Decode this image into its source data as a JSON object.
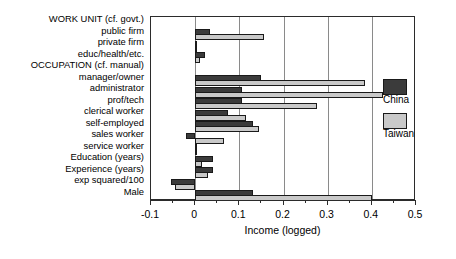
{
  "chart_data": {
    "type": "bar",
    "orientation": "horizontal",
    "title": "",
    "xlabel": "Income (logged)",
    "ylabel": "",
    "xlim": [
      -0.1,
      0.5
    ],
    "xticks": [
      -0.1,
      0,
      0.1,
      0.2,
      0.3,
      0.4,
      0.5
    ],
    "xticklabels": [
      "-0.1",
      "0",
      "0.1",
      "0.2",
      "0.3",
      "0.4",
      "0.5"
    ],
    "minor_tick_step": 0.05,
    "grid": "vertical",
    "legend_position": "right-outside",
    "categories": [
      "WORK UNIT (cf. govt.)",
      "public firm",
      "private firm",
      "educ/health/etc.",
      "OCCUPATION (cf. manual)",
      "manager/owner",
      "administrator",
      "prof/tech",
      "clerical worker",
      "self-employed",
      "sales worker",
      "service worker",
      "Education (years)",
      "Experience (years)",
      "exp squared/100",
      "Male"
    ],
    "header_categories": [
      "WORK UNIT (cf. govt.)",
      "OCCUPATION (cf. manual)"
    ],
    "series": [
      {
        "name": "China",
        "color": "#3b3b3b",
        "values": [
          null,
          0.033,
          0.002,
          0.022,
          null,
          0.15,
          0.105,
          0.105,
          0.075,
          0.13,
          -0.02,
          0.002,
          0.04,
          0.04,
          -0.055,
          0.13
        ]
      },
      {
        "name": "Taiwan",
        "color": "#c9c9c9",
        "values": [
          null,
          0.155,
          0.001,
          0.01,
          null,
          0.385,
          0.425,
          0.275,
          0.115,
          0.145,
          0.065,
          0.003,
          0.015,
          0.03,
          -0.045,
          0.4
        ]
      }
    ]
  },
  "legend": {
    "entries": [
      {
        "label": "China",
        "color": "#3b3b3b"
      },
      {
        "label": "Taiwan",
        "color": "#c9c9c9"
      }
    ]
  }
}
